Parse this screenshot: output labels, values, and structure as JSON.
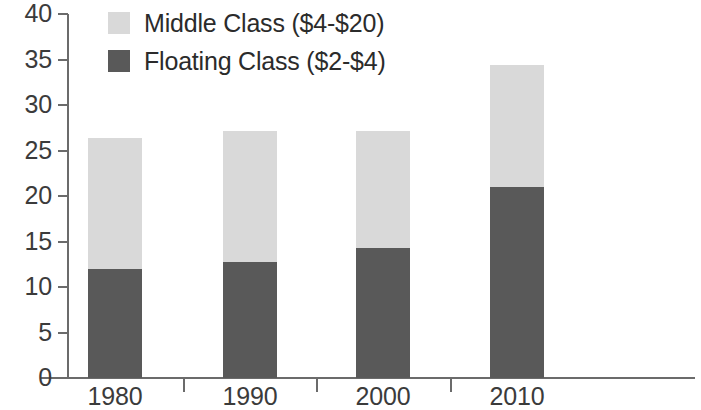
{
  "chart_data": {
    "type": "bar",
    "stacked": true,
    "title": "",
    "subtitle": "",
    "xlabel": "",
    "ylabel": "",
    "categories": [
      "1980",
      "1990",
      "2000",
      "2010"
    ],
    "series": [
      {
        "name": "Floating Class ($2-$4)",
        "color": "#595959",
        "values": [
          12.0,
          12.8,
          14.3,
          21.0
        ]
      },
      {
        "name": "Middle Class ($4-$20)",
        "color": "#d9d9d9",
        "values": [
          14.4,
          14.3,
          12.9,
          13.4
        ]
      }
    ],
    "totals": [
      26.4,
      27.1,
      27.2,
      34.4
    ],
    "ylim": [
      0,
      40
    ],
    "yticks": [
      0,
      5,
      10,
      15,
      20,
      25,
      30,
      35,
      40
    ],
    "ytick_labels": [
      "0",
      "5",
      "10",
      "15",
      "20",
      "25",
      "30",
      "35",
      "40"
    ],
    "xtick_labels": [
      "1980",
      "1990",
      "2000",
      "2010"
    ],
    "grid": false,
    "legend_position": "top-left",
    "legend_order": [
      "Middle Class ($4-$20)",
      "Floating Class ($2-$4)"
    ],
    "axis_color": "#6b6b6b",
    "text_color": "#3b3b3b"
  }
}
